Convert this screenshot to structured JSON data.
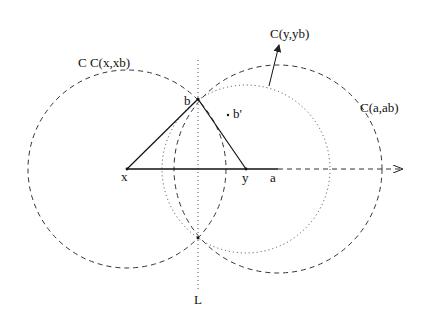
{
  "diagram": {
    "labels": {
      "circle_x": "C  C(x,xb)",
      "circle_y": "C(y,yb)",
      "circle_a": "C(a,ab)",
      "point_b": "b",
      "point_b_prime": "b'",
      "point_x": "x",
      "point_y": "y",
      "point_a": "a",
      "line_L": "L"
    },
    "points": {
      "x": [
        127,
        169
      ],
      "b": [
        198,
        99
      ],
      "y": [
        246,
        169
      ],
      "a": [
        278,
        169
      ],
      "lower_intersection": [
        198,
        238
      ]
    },
    "circles": [
      {
        "name": "C(x,xb)",
        "center": "x",
        "radius": 99,
        "style": "dashed"
      },
      {
        "name": "C(y,yb)",
        "center": "y",
        "radius": 84,
        "style": "dotted"
      },
      {
        "name": "C(a,ab)",
        "center": "a",
        "radius": 104,
        "style": "dashed"
      }
    ],
    "line_L": {
      "x": 198,
      "style": "dotted"
    },
    "colors": {
      "stroke": "#222222",
      "background": "#ffffff"
    }
  }
}
